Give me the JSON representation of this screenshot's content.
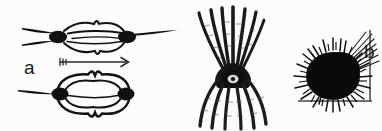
{
  "figure": {
    "background_color": "#fcfcfc",
    "ink_color": "#111111",
    "kind": "scientific-line-drawing",
    "panel_count": 3
  },
  "panels": [
    {
      "id": "a",
      "label": "a",
      "caption_label": "a",
      "description": "Two views of an elongate bilobed colonial organism with dark terminal nodes and tapering axial spines; an arrow between them indicates transformation from the slender form to the inflated barrel form.",
      "elements": {
        "upper_form_name": "slender-elongate-form",
        "lower_form_name": "inflated-barrel-form",
        "arrow_name": "transformation-arrow",
        "arrow_direction": "right",
        "arrow_tail_style": "fletched"
      }
    },
    {
      "id": "b",
      "label": "b",
      "caption_label": "b",
      "description": "Tentaculate organism with a small dark ring-shaped central body, a crown of long curving arms sweeping upward and a skirt of hatched tentacles hanging downward.",
      "elements": {
        "body_name": "central-body-ring",
        "upper_arms_name": "upward-tentacle-crown",
        "lower_arms_name": "downward-tentacle-skirt",
        "upper_arm_count": 7,
        "lower_arm_count": 6
      }
    },
    {
      "id": "c",
      "label": "c",
      "caption_label": "c",
      "description": "Dense spiny spherical organism resting in the corner formed by a vertical and a horizontal substrate line, with longer bristles radiating toward the upper right.",
      "elements": {
        "body_name": "spiny-globular-body",
        "vertical_line_name": "substrate-line-vertical",
        "horizontal_line_name": "substrate-line-horizontal",
        "bristle_tuft_name": "upper-right-bristle-tuft"
      }
    }
  ],
  "colors": {
    "ink": "#111111",
    "ink_soft": "#2b2b2b",
    "paper": "#fcfcfc"
  }
}
